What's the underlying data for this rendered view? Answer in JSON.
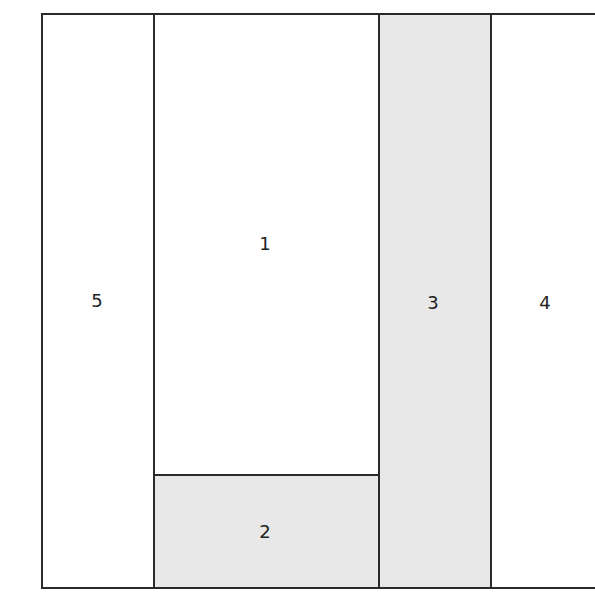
{
  "diagram": {
    "type": "floor-plan-partition",
    "stroke_color": "#2a2a2a",
    "shaded_fill": "#e8e8e8",
    "unshaded_fill": "#ffffff",
    "regions": [
      {
        "label": "1",
        "shaded": false
      },
      {
        "label": "2",
        "shaded": true
      },
      {
        "label": "3",
        "shaded": true
      },
      {
        "label": "4",
        "shaded": false
      },
      {
        "label": "5",
        "shaded": false
      }
    ]
  }
}
